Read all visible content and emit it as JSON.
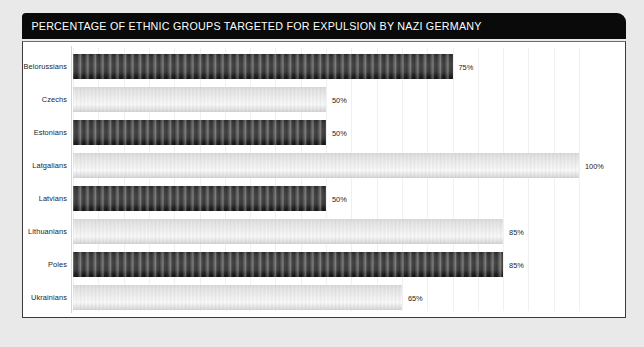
{
  "header": {
    "title": "PERCENTAGE OF ETHNIC GROUPS TARGETED FOR EXPULSION BY NAZI GERMANY"
  },
  "chart_data": {
    "type": "bar",
    "orientation": "horizontal",
    "title": "PERCENTAGE OF ETHNIC GROUPS TARGETED FOR EXPULSION BY NAZI GERMANY",
    "xlabel": "",
    "ylabel": "",
    "xlim": [
      0,
      100
    ],
    "grid": true,
    "legend": false,
    "unit": "%",
    "categories": [
      "Belorussians",
      "Czechs",
      "Estonians",
      "Latgalians",
      "Latvians",
      "Lithuanians",
      "Poles",
      "Ukrainians"
    ],
    "values": [
      75,
      50,
      50,
      100,
      50,
      85,
      85,
      65
    ],
    "value_labels": [
      "75%",
      "50%",
      "50%",
      "100%",
      "50%",
      "85%",
      "85%",
      "65%"
    ],
    "bar_styles": [
      "dark",
      "light",
      "dark",
      "light",
      "dark",
      "light",
      "dark",
      "light"
    ]
  },
  "colors": {
    "page_background": "#e9e9e9",
    "title_bar": "#0a0a0a",
    "title_text": "#fdfdfd",
    "panel_background": "#ffffff",
    "panel_border": "#3b3b3e",
    "gridline": "#f0f0f2",
    "bar_dark": "#3a3a3a",
    "bar_light": "#e6e6e8",
    "label_text": "#1d1d1f"
  }
}
